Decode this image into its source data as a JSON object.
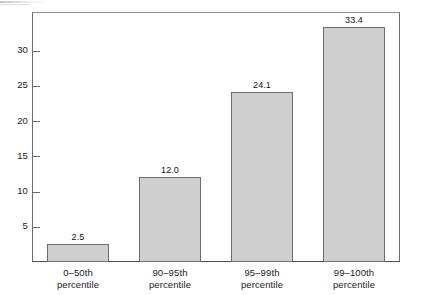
{
  "chart_data": {
    "type": "bar",
    "title": "",
    "subtitle": "",
    "xlabel": "",
    "ylabel": "",
    "categories": [
      "0–50th percentile",
      "90–95th percentile",
      "95–99th percentile",
      "99–100th percentile"
    ],
    "category_lines": [
      [
        "0–50th",
        "percentile"
      ],
      [
        "90–95th",
        "percentile"
      ],
      [
        "95–99th",
        "percentile"
      ],
      [
        "99–100th",
        "percentile"
      ]
    ],
    "values": [
      2.5,
      12.0,
      24.1,
      33.4
    ],
    "value_labels": [
      "2.5",
      "12.0",
      "24.1",
      "33.4"
    ],
    "ylim": [
      0,
      35.5
    ],
    "yticks": [
      5,
      10,
      15,
      20,
      25,
      30
    ],
    "ytick_labels": [
      "5",
      "10",
      "15",
      "20",
      "25",
      "30"
    ],
    "grid": false,
    "legend": null,
    "bar_fill_color": "#cfcfcf",
    "bar_border_color": "#6e6e6e",
    "axis_color": "#6b6b6b",
    "text_color": "#1a1a1a"
  }
}
